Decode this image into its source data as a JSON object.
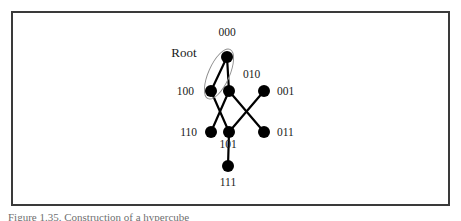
{
  "figure": {
    "frame_color": "#3a3a3a",
    "background": "#ffffff",
    "node_color": "#000000",
    "edge_color": "#000000",
    "ellipse_color": "#8c8c8c",
    "caption": "Figure 1.35. Construction of a hypercube"
  },
  "annotations": [
    {
      "name": "root",
      "text": "Root",
      "x": 184,
      "y": 57
    }
  ],
  "graph": {
    "type": "hypercube-lattice",
    "nodes": [
      {
        "id": "000",
        "label": "000",
        "x": 227,
        "y": 57,
        "r": 6.0,
        "label_x": 227,
        "label_y": 36,
        "label_anchor": "middle"
      },
      {
        "id": "100",
        "label": "100",
        "x": 211,
        "y": 91,
        "r": 6.0,
        "label_x": 194,
        "label_y": 95,
        "label_anchor": "end"
      },
      {
        "id": "010",
        "label": "010",
        "x": 229,
        "y": 91,
        "r": 6.0,
        "label_x": 243,
        "label_y": 78,
        "label_anchor": "start"
      },
      {
        "id": "001",
        "label": "001",
        "x": 264,
        "y": 91,
        "r": 6.0,
        "label_x": 277,
        "label_y": 95,
        "label_anchor": "start"
      },
      {
        "id": "110",
        "label": "110",
        "x": 211,
        "y": 132,
        "r": 6.0,
        "label_x": 197,
        "label_y": 136,
        "label_anchor": "end"
      },
      {
        "id": "101",
        "label": "101",
        "x": 229,
        "y": 132,
        "r": 6.0,
        "label_x": 228,
        "label_y": 148,
        "label_anchor": "middle"
      },
      {
        "id": "011",
        "label": "011",
        "x": 264,
        "y": 132,
        "r": 6.0,
        "label_x": 277,
        "label_y": 136,
        "label_anchor": "start"
      },
      {
        "id": "111",
        "label": "111",
        "x": 228,
        "y": 166,
        "r": 6.0,
        "label_x": 228,
        "label_y": 186,
        "label_anchor": "middle"
      }
    ],
    "edges": [
      {
        "from": "000",
        "to": "100"
      },
      {
        "from": "000",
        "to": "010"
      },
      {
        "from": "100",
        "to": "101"
      },
      {
        "from": "010",
        "to": "110"
      },
      {
        "from": "010",
        "to": "011"
      },
      {
        "from": "001",
        "to": "101"
      },
      {
        "from": "101",
        "to": "111"
      }
    ],
    "ellipse": {
      "name": "root-pair-ellipse",
      "cx": 219,
      "cy": 74,
      "rx": 10.5,
      "ry": 27,
      "rotation": 24
    }
  }
}
